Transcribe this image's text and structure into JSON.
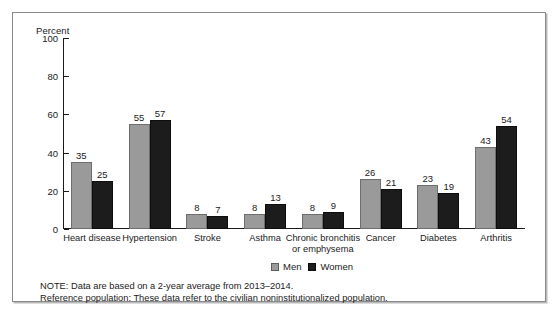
{
  "figure": {
    "percent_axis_title": "Percent",
    "legend": [
      {
        "label": "Men",
        "swatch": "men-swatch",
        "color": "#9a9a9a"
      },
      {
        "label": "Women",
        "swatch": "women-swatch",
        "color": "#1c1c1c"
      }
    ],
    "notes": [
      "NOTE: Data are based on a 2-year average from 2013–2014.",
      "Reference population: These data refer to the civilian noninstitutionalized population."
    ]
  },
  "chart_data": {
    "type": "bar",
    "title": "",
    "xlabel": "",
    "ylabel": "Percent",
    "ylim": [
      0,
      100
    ],
    "yticks": [
      0,
      20,
      40,
      60,
      80,
      100
    ],
    "ytick_labels": [
      "0",
      "20",
      "40",
      "60",
      "80",
      "100"
    ],
    "grid": false,
    "legend_position": "bottom-right",
    "categories": [
      "Heart disease",
      "Hypertension",
      "Stroke",
      "Asthma",
      "Chronic bronchitis or emphysema",
      "Cancer",
      "Diabetes",
      "Arthritis"
    ],
    "category_lines": [
      [
        "Heart disease"
      ],
      [
        "Hypertension"
      ],
      [
        "Stroke"
      ],
      [
        "Asthma"
      ],
      [
        "Chronic bronchitis",
        "or emphysema"
      ],
      [
        "Cancer"
      ],
      [
        "Diabetes"
      ],
      [
        "Arthritis"
      ]
    ],
    "series": [
      {
        "name": "Men",
        "color": "#9a9a9a",
        "values": [
          35,
          55,
          8,
          8,
          8,
          26,
          23,
          43
        ]
      },
      {
        "name": "Women",
        "color": "#1c1c1c",
        "values": [
          25,
          57,
          7,
          13,
          9,
          21,
          19,
          54
        ]
      }
    ]
  }
}
